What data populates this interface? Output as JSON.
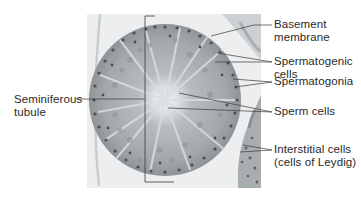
{
  "figure": {
    "colors": {
      "background": "#ffffff",
      "micrograph_bg": "#e9ebec",
      "tissue": "#9ea3a6",
      "tissue_light": "#c4c8ca",
      "lumen": "#eef0f1",
      "nuclei": "#4a4f53",
      "leader_line": "#3a3a3a",
      "label_text": "#2a2a2a"
    },
    "labels": [
      {
        "id": "basement-membrane",
        "line1": "Basement",
        "line2": "membrane"
      },
      {
        "id": "spermatogenic-cells",
        "line1": "Spermatogenic",
        "line2": "cells"
      },
      {
        "id": "spermatogonia",
        "line1": "Spermatogonia",
        "line2": ""
      },
      {
        "id": "sperm-cells",
        "line1": "Sperm cells",
        "line2": ""
      },
      {
        "id": "interstitial-cells",
        "line1": "Interstitial cells",
        "line2": "(cells of Leydig)"
      },
      {
        "id": "seminiferous-tubule",
        "line1": "Seminiferous",
        "line2": "tubule"
      }
    ]
  }
}
